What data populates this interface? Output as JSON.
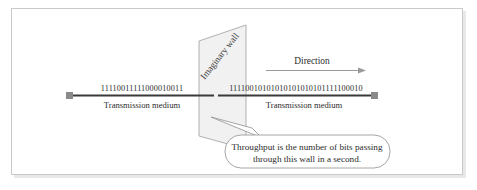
{
  "figure": {
    "colors": {
      "frame_border": "#c9c9c9",
      "frame_shadow": "#e8e8e8",
      "medium_line": "#3a3a3a",
      "terminal_square": "#8a8a8a",
      "wall_fill": "#f0f0f0",
      "wall_stroke": "#9a9a9a",
      "arrow": "#9a9a9a",
      "callout_stroke": "#8f8f8f",
      "text": "#2c2c2c"
    }
  },
  "left_segment": {
    "bits": "11110011111000010011",
    "medium_label": "Transmission medium"
  },
  "right_segment": {
    "bits": "11110010101010101010101111100010",
    "medium_label": "Transmission medium"
  },
  "wall": {
    "label": "Imaginary wall"
  },
  "direction": {
    "label": "Direction",
    "arrow_icon": "arrow-right-icon"
  },
  "callout": {
    "line1": "Throughput is the number of bits passing",
    "line2": "through this wall in a second."
  }
}
